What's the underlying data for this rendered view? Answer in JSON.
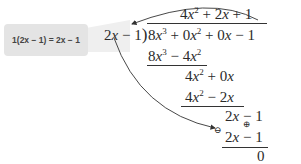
{
  "callout": {
    "text": "1(2x − 1) = 2x − 1"
  },
  "divisor": {
    "text": "2x − 1"
  },
  "quotient": {
    "text": "4x² + 2x + 1"
  },
  "dividend": {
    "text": "8x³ + 0x² + 0x − 1"
  },
  "steps": [
    {
      "text": "8x³ − 4x²",
      "role": "subtract"
    },
    {
      "text": "4x² + 0x",
      "role": "remainder"
    },
    {
      "text": "4x² − 2x",
      "role": "subtract"
    },
    {
      "text": "2x − 1",
      "role": "remainder"
    },
    {
      "text": "2x ⊕ 1",
      "role": "subtract"
    },
    {
      "text": "0",
      "role": "remainder"
    }
  ],
  "annotations": {
    "minus_circle": "⊖",
    "plus_circle": "⊕"
  },
  "colors": {
    "callout_bg": "#e4e4e4",
    "text": "#2a2a2a",
    "arrow": "#333333"
  }
}
